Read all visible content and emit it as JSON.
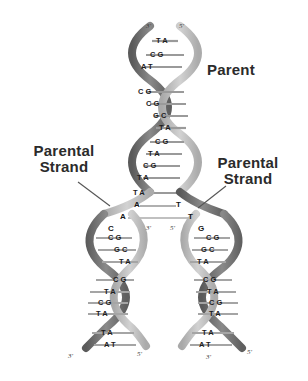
{
  "figure": {
    "background_color": "#ffffff",
    "ribbon_dark_color": "#6e6e6e",
    "ribbon_light_color": "#b9b9b9",
    "rung_light_color": "#e8e8e4",
    "rung_dark_color": "#4a4a4a",
    "text_color": "#2b2b2b"
  },
  "labels": {
    "parent": "Parent",
    "parental_strand_left": "Parental\nStrand",
    "parental_strand_right": "Parental\nStrand"
  },
  "termini": {
    "parent_top_left": "3'",
    "parent_top_right": "5'",
    "fork_left_inner": "3'",
    "fork_right_inner": "5'",
    "daughter_left_bottom_left": "3'",
    "daughter_left_bottom_right": "5'",
    "daughter_right_bottom_left": "3'",
    "daughter_right_bottom_right": "5'"
  },
  "parent_helix": {
    "name": "parent-duplex",
    "base_pairs": [
      {
        "pair": "TA",
        "y": 41
      },
      {
        "pair": "CG",
        "y": 55
      },
      {
        "pair": "AT",
        "y": 67
      },
      {
        "pair": "CG",
        "y": 92
      },
      {
        "pair": "CG",
        "y": 104
      },
      {
        "pair": "GC",
        "y": 116
      },
      {
        "pair": "TA",
        "y": 128
      },
      {
        "pair": "CG",
        "y": 142
      },
      {
        "pair": "TA",
        "y": 154
      },
      {
        "pair": "CG",
        "y": 166
      },
      {
        "pair": "TA",
        "y": 178
      },
      {
        "pair": "TA",
        "y": 193
      }
    ]
  },
  "replication_fork": {
    "name": "replication-fork",
    "unpaired_left": [
      "A",
      "A"
    ],
    "unpaired_right": [
      "T",
      "T"
    ]
  },
  "daughter_left": {
    "name": "daughter-duplex-left",
    "unpaired": [
      "A",
      "A",
      "C"
    ],
    "base_pairs": [
      {
        "pair": "CG",
        "y": 238
      },
      {
        "pair": "GC",
        "y": 250
      },
      {
        "pair": "TA",
        "y": 262
      },
      {
        "pair": "CG",
        "y": 280
      },
      {
        "pair": "TA",
        "y": 292
      },
      {
        "pair": "CG",
        "y": 303
      },
      {
        "pair": "TA",
        "y": 314
      },
      {
        "pair": "TA",
        "y": 333
      },
      {
        "pair": "AT",
        "y": 345
      }
    ]
  },
  "daughter_right": {
    "name": "daughter-duplex-right",
    "unpaired": [
      "T",
      "T",
      "G"
    ],
    "base_pairs": [
      {
        "pair": "CG",
        "y": 238
      },
      {
        "pair": "GC",
        "y": 250
      },
      {
        "pair": "TA",
        "y": 262
      },
      {
        "pair": "CG",
        "y": 280
      },
      {
        "pair": "TA",
        "y": 292
      },
      {
        "pair": "CG",
        "y": 303
      },
      {
        "pair": "TA",
        "y": 314
      },
      {
        "pair": "TA",
        "y": 333
      },
      {
        "pair": "AT",
        "y": 345
      }
    ]
  }
}
